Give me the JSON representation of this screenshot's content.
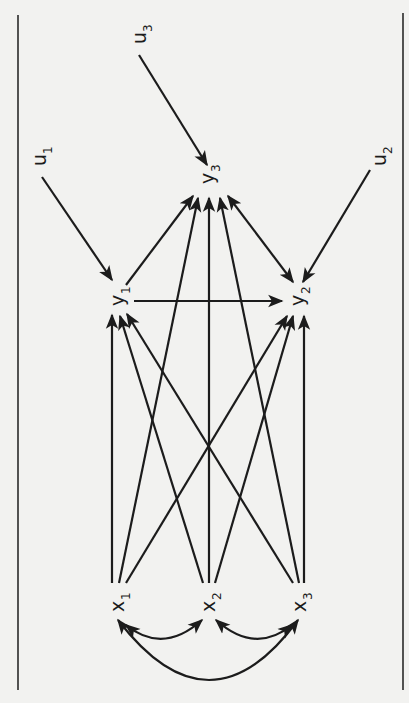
{
  "diagram": {
    "type": "path-diagram",
    "orientation": "rotated-90-clockwise",
    "colors": {
      "background": "#f2f2f0",
      "ink": "#1c1c1c"
    },
    "nodes": [
      {
        "id": "u1",
        "base": "u",
        "sub": "1",
        "x": 40,
        "y": 160
      },
      {
        "id": "u3",
        "base": "u",
        "sub": "3",
        "x": 140,
        "y": 38
      },
      {
        "id": "u2",
        "base": "u",
        "sub": "2",
        "x": 380,
        "y": 160
      },
      {
        "id": "y3",
        "base": "y",
        "sub": "3",
        "x": 208,
        "y": 178
      },
      {
        "id": "y1",
        "base": "y",
        "sub": "1",
        "x": 118,
        "y": 300
      },
      {
        "id": "y2",
        "base": "y",
        "sub": "2",
        "x": 298,
        "y": 300
      },
      {
        "id": "x1",
        "base": "x",
        "sub": "1",
        "x": 118,
        "y": 606
      },
      {
        "id": "x2",
        "base": "x",
        "sub": "2",
        "x": 209,
        "y": 606
      },
      {
        "id": "x3",
        "base": "x",
        "sub": "3",
        "x": 300,
        "y": 606
      }
    ],
    "edges": [
      {
        "from": "u1",
        "to": "y1",
        "type": "directed",
        "path": [
          [
            42,
            177
          ],
          [
            112,
            280
          ]
        ]
      },
      {
        "from": "u3",
        "to": "y3",
        "type": "directed",
        "path": [
          [
            139,
            55
          ],
          [
            207,
            165
          ]
        ]
      },
      {
        "from": "u2",
        "to": "y2",
        "type": "directed",
        "path": [
          [
            370,
            170
          ],
          [
            303,
            282
          ]
        ]
      },
      {
        "from": "y1",
        "to": "y3",
        "type": "directed",
        "path": [
          [
            126,
            285
          ],
          [
            193,
            196
          ]
        ]
      },
      {
        "from": "y1",
        "to": "y2",
        "type": "directed",
        "path": [
          [
            134,
            301
          ],
          [
            282,
            301
          ]
        ]
      },
      {
        "from": "y2",
        "to": "y3",
        "type": "bidirected",
        "path": [
          [
            293,
            282
          ],
          [
            228,
            196
          ]
        ]
      },
      {
        "from": "x1",
        "to": "y1",
        "type": "directed",
        "path": [
          [
            112,
            583
          ],
          [
            112,
            315
          ]
        ]
      },
      {
        "from": "x1",
        "to": "y3",
        "type": "directed",
        "path": [
          [
            119,
            583
          ],
          [
            198,
            198
          ]
        ]
      },
      {
        "from": "x1",
        "to": "y2",
        "type": "directed",
        "path": [
          [
            126,
            583
          ],
          [
            287,
            316
          ]
        ]
      },
      {
        "from": "x2",
        "to": "y1",
        "type": "directed",
        "path": [
          [
            203,
            583
          ],
          [
            120,
            316
          ]
        ]
      },
      {
        "from": "x2",
        "to": "y3",
        "type": "directed",
        "path": [
          [
            209,
            583
          ],
          [
            209,
            198
          ]
        ]
      },
      {
        "from": "x2",
        "to": "y2",
        "type": "directed",
        "path": [
          [
            215,
            583
          ],
          [
            293,
            316
          ]
        ]
      },
      {
        "from": "x3",
        "to": "y1",
        "type": "directed",
        "path": [
          [
            293,
            583
          ],
          [
            127,
            314
          ]
        ]
      },
      {
        "from": "x3",
        "to": "y3",
        "type": "directed",
        "path": [
          [
            299,
            583
          ],
          [
            220,
            198
          ]
        ]
      },
      {
        "from": "x3",
        "to": "y2",
        "type": "directed",
        "path": [
          [
            304,
            583
          ],
          [
            304,
            316
          ]
        ]
      }
    ],
    "curved_edges": [
      {
        "from": "x1",
        "to": "x2",
        "type": "bidirected",
        "d": "M 126 625 Q 163 655 202 620"
      },
      {
        "from": "x2",
        "to": "x3",
        "type": "bidirected",
        "d": "M 216 620 Q 255 655 292 625"
      },
      {
        "from": "x1",
        "to": "x3",
        "type": "bidirected",
        "d": "M 118 620 Q 210 740 298 620"
      }
    ],
    "borders": [
      {
        "side": "left",
        "x": 18,
        "y1": 15,
        "y2": 690
      },
      {
        "side": "right",
        "x": 403,
        "y1": 13,
        "y2": 690
      }
    ]
  }
}
